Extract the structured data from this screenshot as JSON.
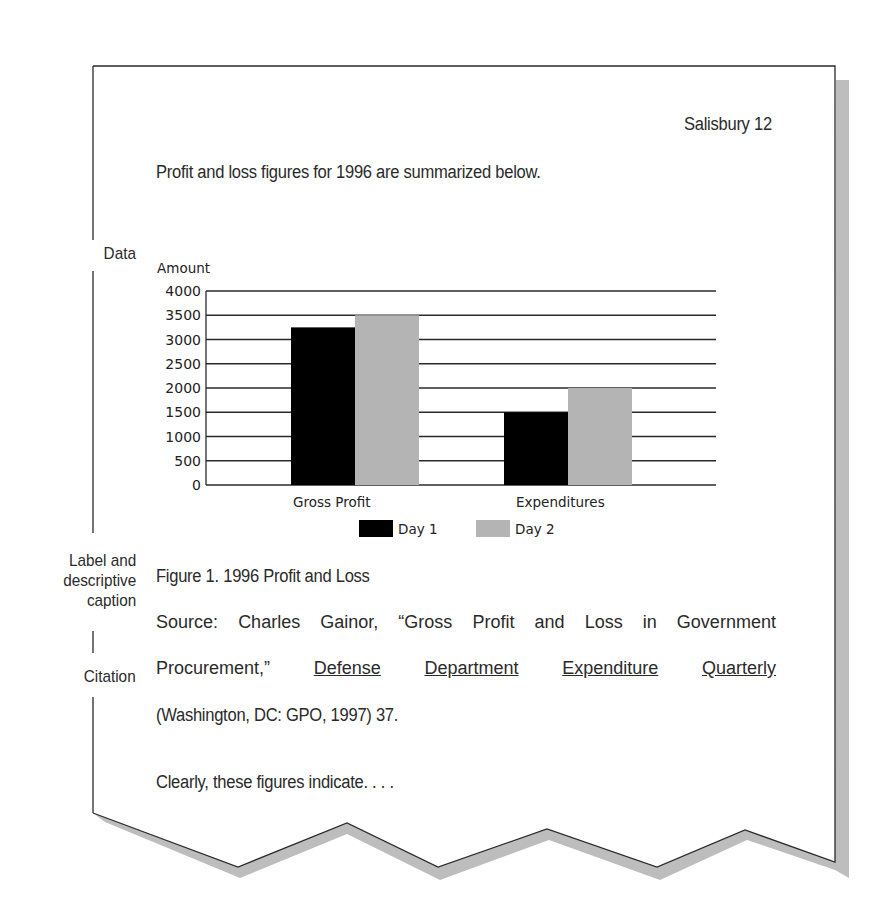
{
  "page": {
    "header": "Salisbury 12",
    "intro": "Profit and loss figures for 1996 are summarized below.",
    "caption": "Figure 1. 1996 Profit and Loss",
    "source_line1_words": [
      "Source:",
      "Charles",
      "Gainor,",
      "“Gross",
      "Profit",
      "and",
      "Loss",
      "in",
      "Government"
    ],
    "source_line2_prefix": "Procurement,”",
    "source_line2_title_words": [
      "Defense",
      "Department",
      "Expenditure",
      "Quarterly"
    ],
    "source_line3": "(Washington, DC: GPO, 1997) 37.",
    "closing": "Clearly, these figures indicate. . . ."
  },
  "margin_labels": {
    "data": "Data",
    "label_caption": [
      "Label and",
      "descriptive",
      "caption"
    ],
    "citation": "Citation"
  },
  "chart_data": {
    "type": "bar",
    "title": "",
    "xlabel": "",
    "ylabel": "Amount",
    "categories": [
      "Gross Profit",
      "Expenditures"
    ],
    "series": [
      {
        "name": "Day 1",
        "color": "#000000",
        "values": [
          3250,
          1500
        ]
      },
      {
        "name": "Day 2",
        "color": "#b4b4b4",
        "values": [
          3500,
          2000
        ]
      }
    ],
    "ylim": [
      0,
      4000
    ],
    "yticks": [
      "4000",
      "3500",
      "3000",
      "2500",
      "2000",
      "1500",
      "1000",
      "500",
      "0"
    ],
    "grid": true,
    "legend_position": "bottom"
  }
}
